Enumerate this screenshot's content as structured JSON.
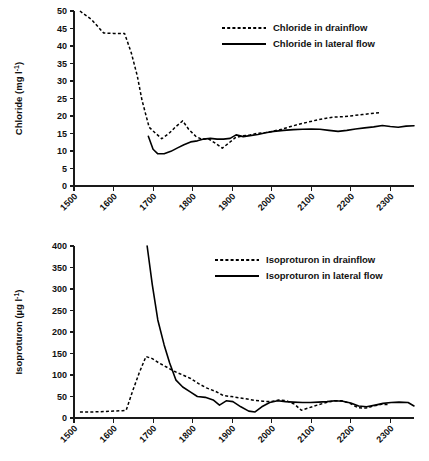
{
  "chart_data": [
    {
      "type": "line",
      "id": "chloride",
      "title": "",
      "xlabel": "",
      "ylabel": "Chloride (mg l⁻¹)",
      "ylabel_base": "Chloride (mg l",
      "ylabel_sup": "-1",
      "ylabel_tail": ")",
      "xlim": [
        1500,
        2360
      ],
      "ylim": [
        0,
        50
      ],
      "xticks": [
        1500,
        1600,
        1700,
        1800,
        1900,
        2000,
        2100,
        2200,
        2300
      ],
      "yticks": [
        0,
        5,
        10,
        15,
        20,
        25,
        30,
        35,
        40,
        45,
        50
      ],
      "grid": false,
      "legend_position": "top-right",
      "series": [
        {
          "name": "Chloride in drainflow",
          "style": "dashed",
          "x": [
            1515,
            1545,
            1575,
            1600,
            1628,
            1645,
            1660,
            1672,
            1690,
            1705,
            1722,
            1740,
            1758,
            1775,
            1790,
            1808,
            1822,
            1840,
            1858,
            1875,
            1892,
            1908,
            1925,
            1945,
            1962,
            1985,
            2005,
            2025,
            2048,
            2068,
            2090,
            2112,
            2135,
            2158,
            2180,
            2205,
            2230,
            2252,
            2275
          ],
          "y": [
            50.0,
            47.5,
            43.7,
            43.6,
            43.6,
            38.0,
            31.5,
            24.5,
            16.8,
            15.2,
            13.5,
            15.0,
            17.0,
            18.6,
            16.2,
            14.2,
            13.4,
            13.5,
            12.2,
            10.8,
            12.3,
            13.8,
            14.3,
            14.6,
            15.0,
            15.3,
            15.7,
            16.2,
            17.0,
            17.6,
            18.2,
            18.8,
            19.3,
            19.7,
            19.8,
            20.1,
            20.4,
            20.7,
            21.0
          ]
        },
        {
          "name": "Chloride in lateral flow",
          "style": "solid",
          "x": [
            1688,
            1700,
            1712,
            1728,
            1745,
            1762,
            1778,
            1795,
            1812,
            1828,
            1845,
            1862,
            1878,
            1895,
            1910,
            1928,
            1945,
            1965,
            1985,
            2005,
            2030,
            2055,
            2078,
            2100,
            2122,
            2145,
            2168,
            2190,
            2212,
            2235,
            2258,
            2280,
            2300,
            2320,
            2340,
            2360
          ],
          "y": [
            14.2,
            10.5,
            9.2,
            9.2,
            9.9,
            10.9,
            11.8,
            12.6,
            12.9,
            13.4,
            13.6,
            13.4,
            13.4,
            13.6,
            14.6,
            14.1,
            14.4,
            14.7,
            15.2,
            15.6,
            15.9,
            16.1,
            16.2,
            16.3,
            16.2,
            15.9,
            15.6,
            15.9,
            16.3,
            16.6,
            16.9,
            17.3,
            17.0,
            16.8,
            17.1,
            17.2
          ]
        }
      ]
    },
    {
      "type": "line",
      "id": "isoproturon",
      "title": "",
      "xlabel": "",
      "ylabel": "Isoproturon (µg l⁻¹)",
      "ylabel_base": "Isoproturon (µg l",
      "ylabel_sup": "-1",
      "ylabel_tail": ")",
      "xlim": [
        1500,
        2360
      ],
      "ylim": [
        0,
        400
      ],
      "xticks": [
        1500,
        1600,
        1700,
        1800,
        1900,
        2000,
        2100,
        2200,
        2300
      ],
      "yticks": [
        0,
        50,
        100,
        150,
        200,
        250,
        300,
        350,
        400
      ],
      "grid": false,
      "legend_position": "top-right",
      "series": [
        {
          "name": "Isoproturon in drainflow",
          "style": "dashed",
          "x": [
            1515,
            1545,
            1575,
            1600,
            1622,
            1632,
            1648,
            1665,
            1682,
            1698,
            1715,
            1735,
            1755,
            1775,
            1795,
            1815,
            1835,
            1858,
            1878,
            1898,
            1918,
            1938,
            1958,
            1978,
            1998,
            2018,
            2038,
            2058,
            2075,
            2095,
            2115,
            2138,
            2158,
            2178,
            2198,
            2218,
            2238,
            2258,
            2278,
            2298
          ],
          "y": [
            14,
            14,
            15,
            16,
            17,
            18,
            62,
            105,
            143,
            138,
            128,
            118,
            108,
            100,
            92,
            80,
            70,
            62,
            52,
            50,
            47,
            44,
            41,
            39,
            38,
            42,
            40,
            32,
            18,
            24,
            30,
            36,
            40,
            40,
            34,
            24,
            23,
            28,
            32,
            31
          ]
        },
        {
          "name": "Isoproturon in lateral flow",
          "style": "solid",
          "x": [
            1685,
            1698,
            1712,
            1728,
            1742,
            1758,
            1775,
            1795,
            1812,
            1832,
            1852,
            1868,
            1885,
            1902,
            1922,
            1942,
            1958,
            1975,
            1995,
            2015,
            2035,
            2055,
            2078,
            2098,
            2118,
            2140,
            2160,
            2180,
            2200,
            2220,
            2240,
            2262,
            2282,
            2302,
            2322,
            2345,
            2360
          ],
          "y": [
            400,
            310,
            228,
            170,
            128,
            88,
            72,
            60,
            50,
            48,
            42,
            30,
            40,
            38,
            26,
            16,
            14,
            26,
            36,
            40,
            38,
            37,
            36,
            36,
            37,
            38,
            40,
            39,
            35,
            28,
            26,
            30,
            34,
            36,
            37,
            36,
            28
          ]
        }
      ]
    }
  ]
}
